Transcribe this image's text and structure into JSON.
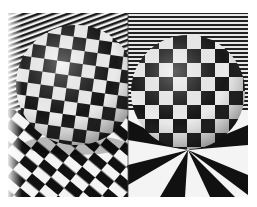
{
  "figure": {
    "panels": [
      {
        "id": "left",
        "texture_mapping": "sphere with distorted checker pattern, diagonal checker floor"
      },
      {
        "id": "right",
        "texture_mapping": "sphere with latitude/longitude checker pattern, radial checker floor"
      }
    ],
    "colors": {
      "black": "#111111",
      "white": "#f4f4f4",
      "background": "#ffffff"
    }
  }
}
